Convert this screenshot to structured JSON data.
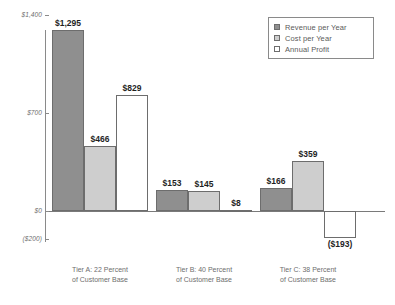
{
  "chart_data": {
    "type": "bar",
    "title": "",
    "subtitle": "",
    "xlabel": "",
    "ylabel": "",
    "grid": false,
    "legend_position": "top-right",
    "ylim": [
      -200,
      1400
    ],
    "ytick_labels": [
      "$1,400",
      "$700",
      "$0",
      "($200)"
    ],
    "ytick_values": [
      1400,
      700,
      0,
      -200
    ],
    "categories": [
      "Tier A: 22 Percent of Customer Base",
      "Tier B: 40 Percent of Customer Base",
      "Tier C: 38 Percent of Customer Base"
    ],
    "category_lines": [
      [
        "Tier A: 22 Percent",
        "of Customer Base"
      ],
      [
        "Tier B: 40 Percent",
        "of Customer Base"
      ],
      [
        "Tier C: 38 Percent",
        "of Customer Base"
      ]
    ],
    "series": [
      {
        "name": "Revenue per Year",
        "color": "#8f8f8f",
        "values": [
          1295,
          153,
          166
        ],
        "labels": [
          "$1,295",
          "$153",
          "$166"
        ]
      },
      {
        "name": "Cost per Year",
        "color": "#cecece",
        "values": [
          466,
          145,
          359
        ],
        "labels": [
          "$466",
          "$145",
          "$359"
        ]
      },
      {
        "name": "Annual Profit",
        "color": "#ffffff",
        "values": [
          829,
          8,
          -193
        ],
        "labels": [
          "$829",
          "$8",
          "($193)"
        ]
      }
    ]
  },
  "legend": {
    "items": [
      {
        "label": "Revenue per Year",
        "swatch": "revenue"
      },
      {
        "label": "Cost per Year",
        "swatch": "cost"
      },
      {
        "label": "Annual Profit",
        "swatch": "profit"
      }
    ]
  },
  "axis": {
    "ticks": [
      {
        "label": "$1,400",
        "value": 1400
      },
      {
        "label": "$700",
        "value": 700
      },
      {
        "label": "$0",
        "value": 0
      },
      {
        "label": "($200)",
        "value": -200
      }
    ]
  },
  "colors": {
    "revenue": "#8f8f8f",
    "cost": "#cecece",
    "profit": "#ffffff",
    "outline": "#6d6d6d",
    "axis": "#8a8a8a",
    "label_text": "#6e6e6e",
    "value_text": "#1f1f1f"
  }
}
